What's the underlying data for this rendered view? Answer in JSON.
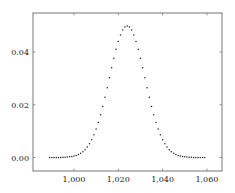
{
  "chart_data": {
    "type": "scatter",
    "title": "",
    "xlabel": "",
    "ylabel": "",
    "xlim": [
      985,
      1063
    ],
    "ylim": [
      -0.005,
      0.054
    ],
    "xticks": [
      1000,
      1020,
      1040,
      1060
    ],
    "xtick_labels": [
      "1,000",
      "1,020",
      "1,040",
      "1,060"
    ],
    "yticks": [
      0.0,
      0.02,
      0.04
    ],
    "ytick_labels": [
      "0.00",
      "0.02",
      "0.04"
    ],
    "grid": false,
    "legend": null,
    "series": [
      {
        "name": "pmf",
        "marker": "dot",
        "color": "#222222",
        "distribution_hint": "approximately normal, mean 1024, std 8",
        "x_start": 989,
        "x_end": 1059,
        "x_step": 1,
        "peak": {
          "x": 1024,
          "y": 0.0499
        }
      }
    ]
  },
  "colors": {
    "axis": "#555555",
    "marker": "#222222"
  }
}
